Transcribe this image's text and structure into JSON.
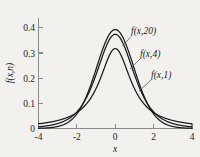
{
  "chart_data": {
    "type": "line",
    "title": "",
    "xlabel": "x",
    "ylabel": "f(x,n)",
    "xlim": [
      -4,
      4
    ],
    "ylim": [
      0,
      0.44
    ],
    "grid": false,
    "legend_position": "inline-annotations",
    "xticks": [
      -4,
      -2,
      0,
      2,
      4
    ],
    "xtick_labels": [
      "-4",
      "-2",
      "0",
      "2",
      "4"
    ],
    "yticks": [
      0,
      0.1,
      0.2,
      0.3,
      0.4
    ],
    "ytick_labels": [
      "0",
      "0.1",
      "0.2",
      "0.3",
      "0.4"
    ],
    "annotations": [
      {
        "text": "f(x,20)",
        "series": "f(x,20)"
      },
      {
        "text": "f(x,4)",
        "series": "f(x,4)"
      },
      {
        "text": "f(x,1)",
        "series": "f(x,1)"
      }
    ],
    "x": [
      -4,
      -3.75,
      -3.5,
      -3.25,
      -3,
      -2.75,
      -2.5,
      -2.25,
      -2,
      -1.75,
      -1.5,
      -1.25,
      -1,
      -0.75,
      -0.5,
      -0.25,
      0,
      0.25,
      0.5,
      0.75,
      1,
      1.25,
      1.5,
      1.75,
      2,
      2.25,
      2.5,
      2.75,
      3,
      3.25,
      3.5,
      3.75,
      4
    ],
    "series": [
      {
        "name": "f(x,20)",
        "values": [
          0.0004,
          0.0008,
          0.0015,
          0.0029,
          0.0053,
          0.0095,
          0.0164,
          0.0273,
          0.0437,
          0.0671,
          0.0988,
          0.1393,
          0.1876,
          0.2409,
          0.2945,
          0.342,
          0.3765,
          0.342,
          0.2945,
          0.2409,
          0.1876,
          0.1393,
          0.0988,
          0.0671,
          0.0437,
          0.0273,
          0.0164,
          0.0095,
          0.0053,
          0.0029,
          0.0015,
          0.0008,
          0.0004
        ]
      },
      {
        "name": "f(x,4)",
        "values": [
          0.0051,
          0.007,
          0.0097,
          0.0137,
          0.0197,
          0.0288,
          0.0427,
          0.0642,
          0.0965,
          0.1429,
          0.206,
          0.2843,
          0.3701,
          0.449,
          0.5041,
          0.5248,
          0.5144,
          0.5248,
          0.5041,
          0.449,
          0.3701,
          0.2843,
          0.206,
          0.1429,
          0.0965,
          0.0642,
          0.0427,
          0.0288,
          0.0197,
          0.0137,
          0.0097,
          0.007,
          0.0051
        ]
      },
      {
        "name": "f(x,1)",
        "values": [
          0.0187,
          0.0212,
          0.0242,
          0.028,
          0.0318,
          0.0374,
          0.0439,
          0.0522,
          0.0637,
          0.0787,
          0.098,
          0.1246,
          0.1592,
          0.2037,
          0.2546,
          0.3,
          0.3183,
          0.3,
          0.2546,
          0.2037,
          0.1592,
          0.1246,
          0.098,
          0.0787,
          0.0637,
          0.0522,
          0.0439,
          0.0374,
          0.0318,
          0.028,
          0.0242,
          0.0212,
          0.0187
        ]
      }
    ],
    "peak_values": {
      "f(x,20)": 0.391,
      "f(x,4)": 0.375,
      "f(x,1)": 0.318
    },
    "colors": {
      "curve": "#1b1b1b",
      "axis": "#8a8a8a",
      "background": "#f2f1ee"
    }
  }
}
